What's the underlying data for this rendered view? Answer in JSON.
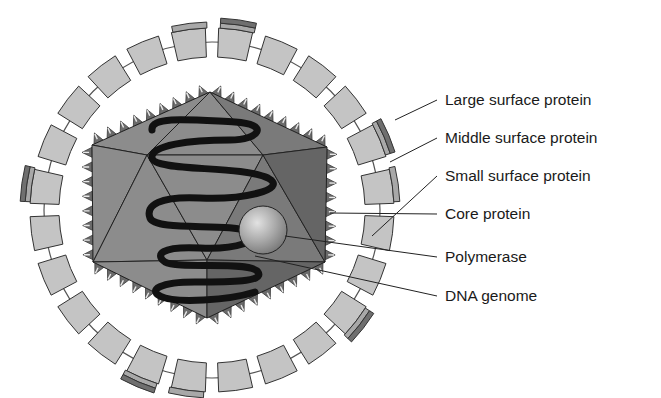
{
  "diagram": {
    "labels": [
      {
        "id": "large-surface-protein",
        "text": "Large surface protein",
        "y": 100
      },
      {
        "id": "middle-surface-protein",
        "text": "Middle surface protein",
        "y": 138
      },
      {
        "id": "small-surface-protein",
        "text": "Small surface protein",
        "y": 176
      },
      {
        "id": "core-protein",
        "text": "Core protein",
        "y": 214
      },
      {
        "id": "polymerase",
        "text": "Polymerase",
        "y": 257
      },
      {
        "id": "dna-genome",
        "text": "DNA genome",
        "y": 296
      }
    ],
    "colors": {
      "envelope_segment": "#c4c4c4",
      "large_protein": "#6f6f6f",
      "middle_protein": "#a8a8a8",
      "capsid_light": "#8c8c8c",
      "capsid_mid": "#7a7a7a",
      "capsid_dark": "#656565",
      "dna": "#111111",
      "outline": "#333333"
    }
  }
}
